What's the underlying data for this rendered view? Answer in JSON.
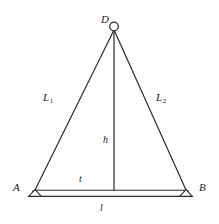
{
  "figure": {
    "kind": "triangular-truss-diagram",
    "stroke_color": "#2b2b2b",
    "fill_color": "#ffffff",
    "background": "#ffffff",
    "vertices": [
      {
        "id": "D",
        "label": "D",
        "x": 114,
        "y": 27,
        "joint": "pin-circle"
      },
      {
        "id": "A",
        "label": "A",
        "x": 35,
        "y": 190,
        "joint": "triangular-support"
      },
      {
        "id": "B",
        "label": "B",
        "x": 186,
        "y": 190,
        "joint": "triangular-support"
      }
    ],
    "members": [
      {
        "id": "L1",
        "label": "L",
        "subscript": "1",
        "from": "A",
        "to": "D"
      },
      {
        "id": "L2",
        "label": "L",
        "subscript": "2",
        "from": "D",
        "to": "B"
      },
      {
        "id": "h",
        "label": "h",
        "from": "D",
        "to": "midspan",
        "kind": "height"
      },
      {
        "id": "t",
        "label": "t",
        "kind": "tie-rod"
      },
      {
        "id": "l",
        "label": "l",
        "kind": "span"
      }
    ],
    "labels": {
      "D": "D",
      "A": "A",
      "B": "B",
      "L1": "L",
      "L1_sub": "1",
      "L2": "L",
      "L2_sub": "2",
      "h": "h",
      "t": "t",
      "l": "l"
    }
  }
}
